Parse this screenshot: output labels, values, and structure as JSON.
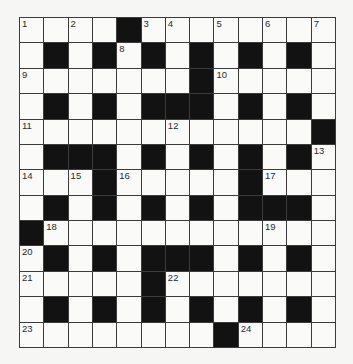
{
  "puzzle": {
    "type": "crossword",
    "rows": 13,
    "cols": 13,
    "colors": {
      "background": "#f6f6f4",
      "cell_white": "#fafaf8",
      "cell_black": "#121212",
      "grid_line": "#3c3c3c",
      "number_text": "#2a2a2a"
    },
    "grid": [
      "....#........",
      ".#.#.#.#.#.#.",
      ".......#.....",
      ".#.#.###.#.#.",
      "............#",
      ".###.#.#.#.#.",
      "...#.....#...",
      ".#.#.#.#.###.",
      "#............",
      ".#.#.###.#.#.",
      ".....#.......",
      ".#.#.#.#.#.#.",
      "........#...."
    ],
    "numbers": [
      {
        "row": 0,
        "col": 0,
        "n": "1"
      },
      {
        "row": 0,
        "col": 2,
        "n": "2"
      },
      {
        "row": 0,
        "col": 5,
        "n": "3"
      },
      {
        "row": 0,
        "col": 6,
        "n": "4"
      },
      {
        "row": 0,
        "col": 8,
        "n": "5"
      },
      {
        "row": 0,
        "col": 10,
        "n": "6"
      },
      {
        "row": 0,
        "col": 12,
        "n": "7"
      },
      {
        "row": 1,
        "col": 4,
        "n": "8"
      },
      {
        "row": 2,
        "col": 0,
        "n": "9"
      },
      {
        "row": 2,
        "col": 8,
        "n": "10"
      },
      {
        "row": 4,
        "col": 0,
        "n": "11"
      },
      {
        "row": 4,
        "col": 6,
        "n": "12"
      },
      {
        "row": 5,
        "col": 12,
        "n": "13"
      },
      {
        "row": 6,
        "col": 0,
        "n": "14"
      },
      {
        "row": 6,
        "col": 2,
        "n": "15"
      },
      {
        "row": 6,
        "col": 4,
        "n": "16"
      },
      {
        "row": 6,
        "col": 10,
        "n": "17"
      },
      {
        "row": 8,
        "col": 1,
        "n": "18"
      },
      {
        "row": 8,
        "col": 10,
        "n": "19"
      },
      {
        "row": 9,
        "col": 0,
        "n": "20"
      },
      {
        "row": 10,
        "col": 0,
        "n": "21"
      },
      {
        "row": 10,
        "col": 6,
        "n": "22"
      },
      {
        "row": 12,
        "col": 0,
        "n": "23"
      },
      {
        "row": 12,
        "col": 9,
        "n": "24"
      }
    ]
  }
}
